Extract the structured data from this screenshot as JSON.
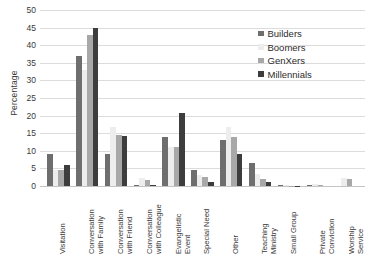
{
  "chart_data": {
    "type": "bar",
    "title": "",
    "xlabel": "",
    "ylabel": "Percentage",
    "ylim": [
      0,
      50
    ],
    "yticks": [
      0,
      5,
      10,
      15,
      20,
      25,
      30,
      35,
      40,
      45,
      50
    ],
    "grid": true,
    "legend_position": "top-right",
    "categories": [
      "Visitation",
      "Conversation with Family",
      "Conversation with Friend",
      "Conversation with Colleague",
      "Evangelistic Event",
      "Special Need",
      "Other",
      "Teaching Ministry",
      "Small Group",
      "Private Conviction",
      "Worship Service"
    ],
    "category_lines": [
      [
        "Visitation"
      ],
      [
        "Conversation",
        "with Family"
      ],
      [
        "Conversation",
        "with Friend"
      ],
      [
        "Conversation",
        "with Colleague"
      ],
      [
        "Evangelistic",
        "Event"
      ],
      [
        "Special Need"
      ],
      [
        "Other"
      ],
      [
        "Teaching",
        "Ministry"
      ],
      [
        "Small Group"
      ],
      [
        "Private",
        "Conviction"
      ],
      [
        "Worship",
        "Service"
      ]
    ],
    "series": [
      {
        "name": "Builders",
        "color": "#6e6e6e",
        "values": [
          9,
          37,
          9,
          0.3,
          14,
          4.5,
          13,
          6.4,
          0.2,
          0.2,
          0
        ]
      },
      {
        "name": "Boomers",
        "color": "#ededed",
        "values": [
          4.5,
          33,
          16.7,
          2.2,
          11,
          3,
          16.8,
          3.3,
          0.2,
          0.6,
          2.2
        ]
      },
      {
        "name": "GenXers",
        "color": "#a8a8a8",
        "values": [
          4.5,
          43,
          14.5,
          1.6,
          11,
          2.7,
          14,
          2,
          0.1,
          0.3,
          2
        ]
      },
      {
        "name": "Millennials",
        "color": "#3d3d3d",
        "values": [
          6,
          45,
          14.2,
          0.3,
          20.7,
          1.2,
          9.2,
          1.2,
          0.1,
          0,
          0
        ]
      }
    ]
  }
}
